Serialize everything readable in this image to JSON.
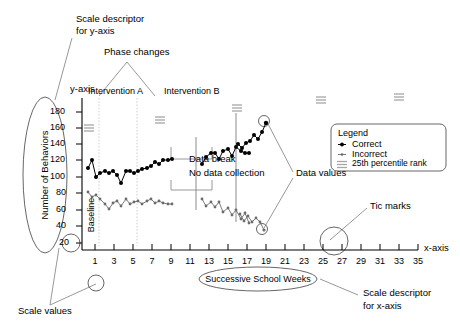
{
  "figure": {
    "title_none": "",
    "annotations": {
      "scale_descriptor_y_l1": "Scale descriptor",
      "scale_descriptor_y_l2": "for y-axis",
      "phase_changes": "Phase changes",
      "y_axis_label": "y-axis",
      "x_axis_label": "x-axis",
      "intervention_a": "Intervention A",
      "intervention_b": "Intervention B",
      "baseline": "Baseline",
      "data_break": "Data break",
      "no_data_collection": "No data collection",
      "data_values": "Data values",
      "tic_marks": "Tic marks",
      "scale_values": "Scale values",
      "scale_descriptor_x_l1": "Scale descriptor",
      "scale_descriptor_x_l2": "for x-axis",
      "successive_school_weeks": "Successive School Weeks",
      "y_axis_title": "Number of Behaviors"
    },
    "legend": {
      "title": "Legend",
      "items": [
        {
          "label": "Correct",
          "marker": "filled-circle-line",
          "color": "#000000"
        },
        {
          "label": "Incorrect",
          "marker": "small-dot-line",
          "color": "#555555"
        },
        {
          "label": "25th percentile rank",
          "marker": "triple-bar",
          "color": "#9a9a9a"
        }
      ]
    },
    "colors": {
      "correct": "#000000",
      "incorrect": "#6b6b6b",
      "percentile": "#a6a6a6",
      "axis": "#000000",
      "leader": "#8c8c8c",
      "phase_line": "#cfcfcf"
    }
  },
  "chart_data": {
    "type": "line",
    "title": "",
    "xlabel": "Successive School Weeks",
    "ylabel": "Number of Behaviors",
    "xlim": [
      0,
      36
    ],
    "ylim": [
      20,
      190
    ],
    "yticks": [
      20,
      40,
      60,
      80,
      100,
      120,
      140,
      160,
      180
    ],
    "xticks": [
      1,
      3,
      5,
      7,
      9,
      11,
      13,
      15,
      17,
      19,
      21,
      23,
      25,
      27,
      29,
      31,
      33,
      35
    ],
    "xtick_labels": [
      "1",
      "3",
      "5",
      "7",
      "9",
      "11",
      "13",
      "15",
      "17",
      "19",
      "21",
      "23",
      "25",
      "27",
      "29",
      "31",
      "33",
      "35"
    ],
    "grid": false,
    "legend_position": "right",
    "phases": [
      {
        "name": "Baseline",
        "x_start": 0.5,
        "x_end": 2.5
      },
      {
        "name": "Intervention A",
        "x_start": 2.5,
        "x_end": 7.1
      },
      {
        "name": "Intervention B",
        "x_start": 7.1,
        "x_end": 21.0
      }
    ],
    "phase_change_lines": [
      2.5,
      7.1
    ],
    "data_break_x": [
      10.0,
      10.9
    ],
    "series": [
      {
        "name": "Correct",
        "marker": "filled-circle",
        "color": "#000000",
        "x": [
          1,
          1.45,
          1.9,
          2.35,
          2.8,
          3.25,
          3.7,
          4.15,
          4.6,
          5.05,
          5.5,
          5.95,
          6.4,
          6.85,
          7.3,
          7.75,
          8.2,
          8.65,
          9.1,
          9.55,
          10.0,
          10.9,
          11.35,
          11.8,
          12.25,
          12.7,
          13.15,
          13.6,
          14.05,
          14.5,
          14.95,
          15.4,
          15.85,
          16.5,
          16.95,
          17.4,
          17.85,
          18.3,
          18.75,
          19.2,
          19.65
        ],
        "y": [
          112,
          120,
          100,
          106,
          108,
          106,
          108,
          104,
          96,
          108,
          108,
          106,
          108,
          110,
          112,
          114,
          118,
          116,
          120,
          120,
          122,
          116,
          124,
          128,
          128,
          122,
          130,
          132,
          126,
          134,
          130,
          128,
          128,
          140,
          136,
          142,
          144,
          150,
          146,
          154,
          162
        ],
        "circled_points": [
          {
            "x": 19.65,
            "y": 162,
            "note": "data value callout"
          }
        ]
      },
      {
        "name": "Incorrect",
        "marker": "small-dot",
        "color": "#6b6b6b",
        "x": [
          1,
          1.45,
          1.9,
          2.35,
          2.8,
          3.25,
          3.7,
          4.15,
          4.6,
          5.05,
          5.5,
          5.95,
          6.4,
          6.85,
          7.3,
          7.75,
          8.2,
          8.65,
          9.1,
          9.55,
          10.0,
          10.9,
          11.35,
          11.8,
          12.25,
          12.7,
          13.15,
          13.6,
          14.05,
          14.5,
          14.95,
          15.4,
          15.85,
          16.5,
          16.95,
          17.4,
          17.85,
          18.3,
          18.75,
          19.2,
          19.65
        ],
        "y": [
          82,
          76,
          78,
          74,
          68,
          62,
          70,
          72,
          66,
          74,
          68,
          70,
          72,
          68,
          72,
          74,
          70,
          72,
          70,
          68,
          68,
          74,
          66,
          70,
          64,
          70,
          58,
          62,
          54,
          60,
          50,
          56,
          44,
          54,
          46,
          52,
          44,
          50,
          44,
          48,
          38
        ],
        "circled_points": [
          {
            "x": 19.65,
            "y": 38,
            "note": "data value callout"
          }
        ]
      },
      {
        "name": "25th percentile rank",
        "marker": "triple-bar",
        "color": "#a6a6a6",
        "points": [
          {
            "x": 1.0,
            "y": 160
          },
          {
            "x": 6.2,
            "y": 166
          },
          {
            "x": 14.0,
            "y": 176
          },
          {
            "x": 23.0,
            "y": 170
          },
          {
            "x": 31.0,
            "y": 176
          }
        ]
      }
    ]
  }
}
